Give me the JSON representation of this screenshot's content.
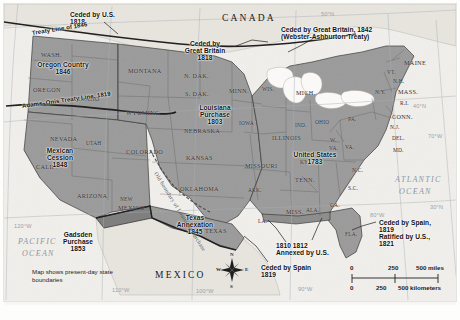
{
  "figure": {
    "kind": "historical-map",
    "note": "Map shows present-day state boundaries"
  },
  "colors": {
    "land_acquired": "#9a9a9a",
    "land_foreign": "#e4e1db",
    "ocean": "#f1efeb",
    "great_lakes": "#fbfaf8",
    "graticule": "#9aa3ac",
    "border_dark": "#2a2a2a",
    "page": "#f2f0ec"
  },
  "countries": [
    {
      "name": "CANADA",
      "x": 222,
      "y": 14
    },
    {
      "name": "MEXICO",
      "x": 155,
      "y": 271
    }
  ],
  "oceans": [
    {
      "name": "ATLANTIC",
      "x": 395,
      "y": 176
    },
    {
      "name": "OCEAN",
      "x": 399,
      "y": 188
    },
    {
      "name": "PACIFIC",
      "x": 18,
      "y": 238
    },
    {
      "name": "OCEAN",
      "x": 22,
      "y": 250
    }
  ],
  "annotations": [
    {
      "id": "ceded-by-us-1818",
      "lines": [
        "Ceded by U.S.",
        "1818"
      ],
      "x": 70,
      "y": 12,
      "align": "left"
    },
    {
      "id": "treaty-line-1846",
      "lines": [
        "Treaty Line of 1846"
      ],
      "x": 32,
      "y": 30,
      "align": "left",
      "rotate": -9
    },
    {
      "id": "adams-onis-line-1819",
      "lines": [
        "Adams–Onis Treaty Line, 1819"
      ],
      "x": 22,
      "y": 103,
      "align": "left",
      "rotate": -8
    },
    {
      "id": "oregon-country-1846",
      "lines": [
        "Oregon Country",
        "1846"
      ],
      "x": 63,
      "y": 62,
      "align": "center"
    },
    {
      "id": "ceded-by-great-britain-1818",
      "lines": [
        "Ceded by",
        "Great Britain",
        "1818"
      ],
      "x": 205,
      "y": 41,
      "align": "center"
    },
    {
      "id": "webster-ashburton-1842",
      "lines": [
        "Ceded by Great Britain, 1842",
        "(Webster-Ashburton Treaty)"
      ],
      "x": 281,
      "y": 27,
      "align": "left"
    },
    {
      "id": "louisiana-purchase-1803",
      "lines": [
        "Louisiana",
        "Purchase",
        "1803"
      ],
      "x": 215,
      "y": 105,
      "align": "center"
    },
    {
      "id": "mexican-cession-1848",
      "lines": [
        "Mexican",
        "Cession",
        "1848"
      ],
      "x": 60,
      "y": 148,
      "align": "center"
    },
    {
      "id": "gadsden-purchase-1853",
      "lines": [
        "Gadsden",
        "Purchase",
        "1853"
      ],
      "x": 78,
      "y": 232,
      "align": "center"
    },
    {
      "id": "texas-annexation-1845",
      "lines": [
        "Texas",
        "Annexation",
        "1845"
      ],
      "x": 195,
      "y": 215,
      "align": "center"
    },
    {
      "id": "united-states-1783",
      "lines": [
        "United States",
        "1783"
      ],
      "x": 315,
      "y": 152,
      "align": "center"
    },
    {
      "id": "ceded-by-spain-1819-florida",
      "lines": [
        "Ceded by Spain,",
        "1819",
        "Ratified by U.S.,",
        "1821"
      ],
      "x": 379,
      "y": 220,
      "align": "left"
    },
    {
      "id": "annexed-by-us-1810-1812",
      "lines": [
        "1810  1812",
        "Annexed by U.S."
      ],
      "x": 276,
      "y": 243,
      "align": "left"
    },
    {
      "id": "ceded-by-spain-1819-texas",
      "lines": [
        "Ceded by Spain",
        "1819"
      ],
      "x": 261,
      "y": 265,
      "align": "left"
    },
    {
      "id": "old-boundary-louisiana-purchase",
      "lines": [
        "Old boundary of Louisiana Purchase"
      ],
      "x": 155,
      "y": 170,
      "align": "left",
      "rotate": 58
    }
  ],
  "states": [
    {
      "abbr": "WASH.",
      "x": 41,
      "y": 52
    },
    {
      "abbr": "OREGON",
      "x": 33,
      "y": 87
    },
    {
      "abbr": "IDAHO",
      "x": 78,
      "y": 96
    },
    {
      "abbr": "MONTANA",
      "x": 128,
      "y": 68
    },
    {
      "abbr": "WYOMING",
      "x": 126,
      "y": 110
    },
    {
      "abbr": "NEVADA",
      "x": 50,
      "y": 136
    },
    {
      "abbr": "UTAH",
      "x": 86,
      "y": 141
    },
    {
      "abbr": "CALIF.",
      "x": 36,
      "y": 164
    },
    {
      "abbr": "ARIZONA",
      "x": 77,
      "y": 193
    },
    {
      "abbr": "COLORADO",
      "x": 126,
      "y": 149
    },
    {
      "abbr": "NEW",
      "x": 120,
      "y": 197
    },
    {
      "abbr": "MEXICO",
      "x": 118,
      "y": 205
    },
    {
      "abbr": "N. DAK.",
      "x": 184,
      "y": 73
    },
    {
      "abbr": "S. DAK.",
      "x": 185,
      "y": 91
    },
    {
      "abbr": "NEBRASKA",
      "x": 184,
      "y": 128
    },
    {
      "abbr": "KANSAS",
      "x": 186,
      "y": 155
    },
    {
      "abbr": "OKLAHOMA",
      "x": 180,
      "y": 186
    },
    {
      "abbr": "TEXAS",
      "x": 205,
      "y": 228
    },
    {
      "abbr": "MINN.",
      "x": 229,
      "y": 88
    },
    {
      "abbr": "IOWA",
      "x": 239,
      "y": 121
    },
    {
      "abbr": "MISSOURI",
      "x": 245,
      "y": 163
    },
    {
      "abbr": "ARK.",
      "x": 248,
      "y": 188
    },
    {
      "abbr": "LA.",
      "x": 258,
      "y": 219
    },
    {
      "abbr": "WIS.",
      "x": 262,
      "y": 87
    },
    {
      "abbr": "ILLINOIS",
      "x": 272,
      "y": 135
    },
    {
      "abbr": "MISS.",
      "x": 286,
      "y": 209
    },
    {
      "abbr": "ALA.",
      "x": 306,
      "y": 208
    },
    {
      "abbr": "TENN.",
      "x": 295,
      "y": 177
    },
    {
      "abbr": "KY.",
      "x": 300,
      "y": 160
    },
    {
      "abbr": "IND.",
      "x": 295,
      "y": 123
    },
    {
      "abbr": "MICH.",
      "x": 296,
      "y": 90
    },
    {
      "abbr": "OHIO",
      "x": 315,
      "y": 120
    },
    {
      "abbr": "GA.",
      "x": 330,
      "y": 203
    },
    {
      "abbr": "FLA.",
      "x": 345,
      "y": 232
    },
    {
      "abbr": "S.C.",
      "x": 348,
      "y": 186
    },
    {
      "abbr": "N.C.",
      "x": 352,
      "y": 168
    },
    {
      "abbr": "VA.",
      "x": 345,
      "y": 145
    },
    {
      "abbr": "W.",
      "x": 330,
      "y": 138
    },
    {
      "abbr": "VA.",
      "x": 329,
      "y": 146
    },
    {
      "abbr": "PA.",
      "x": 348,
      "y": 117
    },
    {
      "abbr": "N.Y.",
      "x": 375,
      "y": 90
    },
    {
      "abbr": "MD.",
      "x": 393,
      "y": 148
    },
    {
      "abbr": "DEL.",
      "x": 392,
      "y": 136
    },
    {
      "abbr": "N.J.",
      "x": 390,
      "y": 125
    },
    {
      "abbr": "CONN.",
      "x": 392,
      "y": 114
    },
    {
      "abbr": "R.I.",
      "x": 400,
      "y": 101
    },
    {
      "abbr": "MASS.",
      "x": 398,
      "y": 89
    },
    {
      "abbr": "N.H.",
      "x": 393,
      "y": 79
    },
    {
      "abbr": "VT.",
      "x": 387,
      "y": 70
    },
    {
      "abbr": "MAINE",
      "x": 404,
      "y": 60
    }
  ],
  "graticule": [
    {
      "label": "50°N",
      "x": 321,
      "y": 12
    },
    {
      "label": "40°N",
      "x": 413,
      "y": 104
    },
    {
      "label": "30°N",
      "x": 430,
      "y": 205
    },
    {
      "label": "70°W",
      "x": 428,
      "y": 134
    },
    {
      "label": "80°W",
      "x": 370,
      "y": 213
    },
    {
      "label": "90°W",
      "x": 298,
      "y": 287
    },
    {
      "label": "100°W",
      "x": 196,
      "y": 289
    },
    {
      "label": "110°W",
      "x": 112,
      "y": 288
    },
    {
      "label": "120°W",
      "x": 14,
      "y": 224
    }
  ],
  "scale_bar": {
    "miles_label": "500 miles",
    "km_label": "500 kilometers",
    "miles_ticks": [
      "0",
      "250",
      "500"
    ],
    "km_ticks": [
      "0",
      "250",
      "500"
    ]
  },
  "compass": {
    "n": "N",
    "s": "S",
    "e": "E",
    "w": "W"
  }
}
